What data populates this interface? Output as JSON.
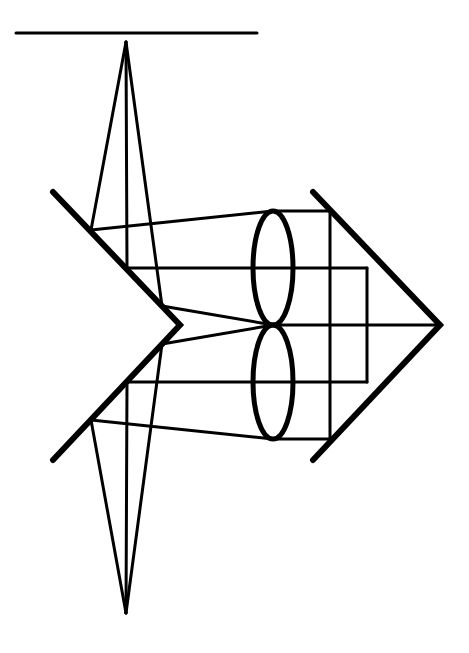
{
  "diagram": {
    "title": "",
    "type": "optical-ray-diagram",
    "colors": {
      "stroke": "#000000",
      "background": "#ffffff"
    },
    "elements": {
      "top_line": {
        "x1": 16,
        "y1": 33,
        "x2": 257,
        "y2": 33
      },
      "top_apex": {
        "x": 126,
        "y": 42
      },
      "bottom_apex": {
        "x": 126,
        "y": 613
      },
      "left_chevron": [
        [
          53,
          192
        ],
        [
          180,
          325
        ],
        [
          53,
          460
        ]
      ],
      "right_chevron": [
        [
          313,
          192
        ],
        [
          440,
          325
        ],
        [
          313,
          460
        ]
      ],
      "lenses": [
        {
          "cx": 273,
          "cy": 268,
          "rx": 20,
          "ry": 57
        },
        {
          "cx": 273,
          "cy": 382,
          "rx": 20,
          "ry": 57
        }
      ]
    }
  }
}
